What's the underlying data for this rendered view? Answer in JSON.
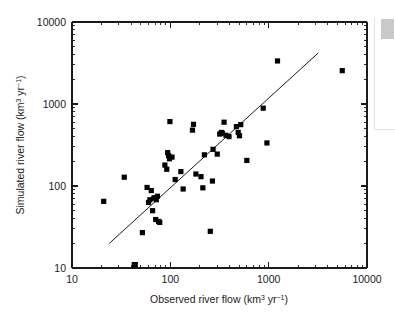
{
  "figure": {
    "name": "river-flow-scatter",
    "background": "#ffffff",
    "marker_color": "#000000",
    "axis_color": "#1a1a1a"
  },
  "ui": {
    "right_panel_name": "side-panel",
    "scroll_thumb_name": "scrollbar-thumb",
    "scroll_thumb_color": "#c9c9c9"
  },
  "chart_data": {
    "type": "scatter",
    "title": "",
    "xlabel_text": "Observed river flow (km",
    "xlabel_unit_sup1": "3",
    "xlabel_unit_mid": " yr",
    "xlabel_unit_sup2": "-1",
    "xlabel_unit_close": ")",
    "xlabel_full": "Observed river flow (km3 yr-1)",
    "ylabel_text": "Simulated river flow (km",
    "ylabel_unit_sup1": "3",
    "ylabel_unit_mid": " yr",
    "ylabel_unit_sup2": "-1",
    "ylabel_unit_close": ")",
    "ylabel_full": "Simulated river flow (km3 yr-1)",
    "xscale": "log",
    "yscale": "log",
    "xlim": [
      10,
      10000
    ],
    "ylim": [
      10,
      10000
    ],
    "xticks": [
      10,
      100,
      1000,
      10000
    ],
    "xtick_labels": [
      "10",
      "100",
      "1000",
      "10000"
    ],
    "yticks": [
      10,
      100,
      1000,
      10000
    ],
    "ytick_labels": [
      "10",
      "100",
      "1000",
      "10000"
    ],
    "grid": false,
    "legend": false,
    "series": [
      {
        "name": "river basins",
        "marker": "square",
        "color": "#000000",
        "points": [
          [
            21,
            65
          ],
          [
            34,
            128
          ],
          [
            43,
            11
          ],
          [
            44,
            11
          ],
          [
            52,
            27
          ],
          [
            58,
            96
          ],
          [
            60,
            63
          ],
          [
            62,
            68
          ],
          [
            64,
            88
          ],
          [
            66,
            50
          ],
          [
            68,
            71
          ],
          [
            70,
            72
          ],
          [
            71,
            39
          ],
          [
            72,
            68
          ],
          [
            74,
            75
          ],
          [
            76,
            37
          ],
          [
            78,
            36
          ],
          [
            88,
            180
          ],
          [
            92,
            160
          ],
          [
            94,
            255
          ],
          [
            96,
            235
          ],
          [
            98,
            215
          ],
          [
            99,
            610
          ],
          [
            104,
            225
          ],
          [
            112,
            120
          ],
          [
            128,
            150
          ],
          [
            135,
            92
          ],
          [
            168,
            480
          ],
          [
            172,
            565
          ],
          [
            182,
            140
          ],
          [
            205,
            130
          ],
          [
            214,
            95
          ],
          [
            222,
            240
          ],
          [
            255,
            28
          ],
          [
            268,
            115
          ],
          [
            272,
            280
          ],
          [
            300,
            245
          ],
          [
            318,
            430
          ],
          [
            330,
            450
          ],
          [
            338,
            440
          ],
          [
            352,
            600
          ],
          [
            368,
            415
          ],
          [
            395,
            400
          ],
          [
            470,
            530
          ],
          [
            490,
            450
          ],
          [
            505,
            410
          ],
          [
            520,
            560
          ],
          [
            600,
            205
          ],
          [
            880,
            890
          ],
          [
            960,
            335
          ],
          [
            1230,
            3350
          ],
          [
            5600,
            2550
          ]
        ]
      }
    ],
    "fit_line": {
      "name": "1:1 reference line",
      "x_start": 24,
      "y_start": 20,
      "x_end": 3200,
      "y_end": 4200
    }
  }
}
